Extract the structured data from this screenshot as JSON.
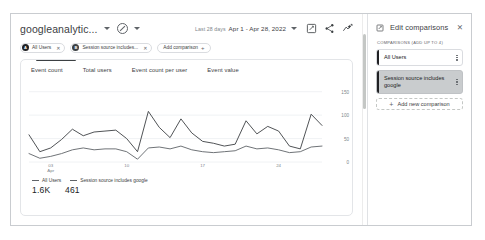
{
  "report": {
    "title": "googleanalytic...",
    "property_icon": "no-entry-circle-icon",
    "date": {
      "period_label": "Last 28 days",
      "range": "Apr 1 - Apr 28, 2022"
    },
    "header_icons": [
      {
        "name": "edit-comparisons-icon",
        "label": "Edit comparisons"
      },
      {
        "name": "share-icon",
        "label": "Share this report"
      },
      {
        "name": "insights-icon",
        "label": "Insights"
      }
    ],
    "chips": [
      {
        "label": "All Users",
        "badge": "A",
        "badge_color": "#202124",
        "close": "✕"
      },
      {
        "label": "Session source includes...",
        "badge": "B",
        "badge_color": "#3c4043",
        "close": "✕"
      }
    ],
    "add_comparison_label": "Add comparison"
  },
  "card": {
    "tabs": [
      {
        "label": "Event count",
        "active": true
      },
      {
        "label": "Total users",
        "active": false
      },
      {
        "label": "Event count per user",
        "active": false
      },
      {
        "label": "Event value",
        "active": false
      }
    ]
  },
  "legend": {
    "series": [
      {
        "label": "All Users",
        "value": "1.6K",
        "color": "#3c4043"
      },
      {
        "label": "Session source includes google",
        "value": "461",
        "color": "#5f6368"
      }
    ]
  },
  "panel": {
    "icon": "edit-comparisons-icon",
    "title": "Edit comparisons",
    "close_label": "✕",
    "section_label": "COMPARISONS (ADD UP TO 4)",
    "comparisons": [
      {
        "label": "All Users",
        "selected": false
      },
      {
        "label": "Session source includes google",
        "selected": true
      }
    ],
    "add_new_label": "Add new comparison",
    "add_new_plus": "+"
  },
  "chart_data": {
    "type": "line",
    "title": "Event count",
    "xlabel": "",
    "ylabel": "",
    "ylim": [
      0,
      175
    ],
    "grid": true,
    "legend_position": "bottom-left",
    "yticks": [
      150,
      100,
      50,
      0
    ],
    "xticks": [
      {
        "pos": 2,
        "label": "03",
        "sublabel": "Apr"
      },
      {
        "pos": 9,
        "label": "10",
        "sublabel": ""
      },
      {
        "pos": 16,
        "label": "17",
        "sublabel": ""
      },
      {
        "pos": 23,
        "label": "24",
        "sublabel": ""
      }
    ],
    "x": [
      0,
      1,
      2,
      3,
      4,
      5,
      6,
      7,
      8,
      9,
      10,
      11,
      12,
      13,
      14,
      15,
      16,
      17,
      18,
      19,
      20,
      21,
      22,
      23,
      24,
      25,
      26,
      27
    ],
    "series": [
      {
        "name": "All Users",
        "color": "#3c4043",
        "total": "1.6K",
        "values": [
          58,
          22,
          30,
          48,
          70,
          56,
          64,
          66,
          68,
          50,
          22,
          108,
          74,
          52,
          92,
          62,
          44,
          40,
          34,
          38,
          88,
          60,
          76,
          66,
          34,
          28,
          102,
          78
        ]
      },
      {
        "name": "Session source includes google",
        "color": "#5f6368",
        "total": "461",
        "values": [
          18,
          8,
          12,
          18,
          26,
          30,
          26,
          28,
          28,
          22,
          6,
          30,
          32,
          28,
          34,
          26,
          22,
          20,
          22,
          24,
          34,
          28,
          30,
          26,
          20,
          22,
          32,
          34
        ]
      }
    ]
  }
}
